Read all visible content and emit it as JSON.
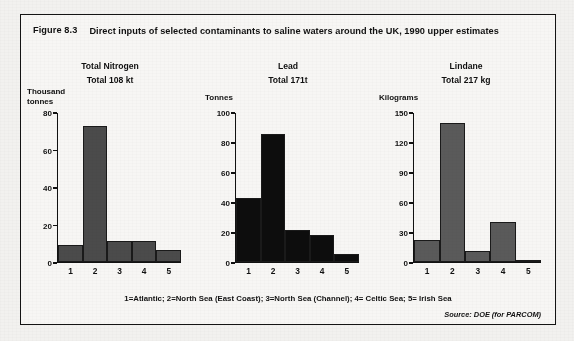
{
  "figure": {
    "number": "Figure 8.3",
    "title": "Direct inputs of selected contaminants to saline waters around the UK, 1990 upper estimates",
    "footnote": "1=Atlantic; 2=North Sea (East Coast); 3=North Sea (Channel); 4= Celtic Sea; 5= Irish Sea",
    "source": "Source: DOE (for PARCOM)"
  },
  "chart_data": [
    {
      "type": "bar",
      "title": "Total Nitrogen",
      "subtitle": "Total  108 kt",
      "ylabel": "Thousand\ntonnes",
      "xlabel": "",
      "categories": [
        "1",
        "2",
        "3",
        "4",
        "5"
      ],
      "values": [
        9,
        73,
        11,
        11,
        6
      ],
      "ylim": [
        0,
        80
      ],
      "yticks": [
        0,
        20,
        40,
        60,
        80
      ],
      "bar_color": "#4b4b4b",
      "grid": false,
      "legend": "none"
    },
    {
      "type": "bar",
      "title": "Lead",
      "subtitle": "Total 171t",
      "ylabel": "Tonnes",
      "xlabel": "",
      "categories": [
        "1",
        "2",
        "3",
        "4",
        "5"
      ],
      "values": [
        43,
        86,
        21,
        18,
        5
      ],
      "ylim": [
        0,
        100
      ],
      "yticks": [
        0,
        20,
        40,
        60,
        80,
        100
      ],
      "bar_color": "#0d0d0d",
      "grid": false,
      "legend": "none"
    },
    {
      "type": "bar",
      "title": "Lindane",
      "subtitle": "Total 217 kg",
      "ylabel": "Kilograms",
      "xlabel": "",
      "categories": [
        "1",
        "2",
        "3",
        "4",
        "5"
      ],
      "values": [
        22,
        140,
        11,
        40,
        1
      ],
      "ylim": [
        0,
        150
      ],
      "yticks": [
        0,
        30,
        60,
        90,
        120,
        150
      ],
      "bar_color": "#5a5a5a",
      "grid": false,
      "legend": "none"
    }
  ]
}
